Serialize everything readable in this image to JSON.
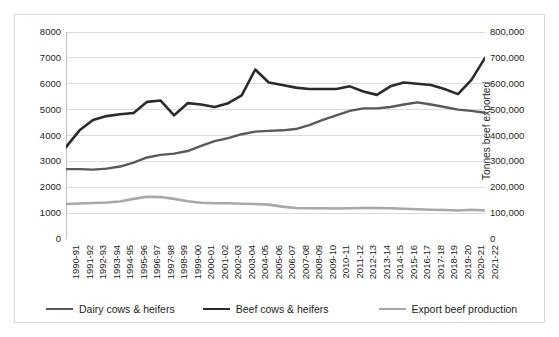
{
  "chart_data": {
    "type": "line",
    "title": "",
    "xlabel": "",
    "ylabel": "Head ('000s)",
    "y2label": "Tonnes beef exported",
    "ylim": [
      0,
      8000
    ],
    "y2lim": [
      0,
      800000
    ],
    "grid": true,
    "legend_position": "bottom",
    "categories": [
      "1990-91",
      "1991-92",
      "1992-93",
      "1993-94",
      "1994-95",
      "1995-96",
      "1996-97",
      "1997-98",
      "1998-99",
      "1999-00",
      "2000-01",
      "2001-02",
      "2002-03",
      "2003-04",
      "2004-05",
      "2005-06",
      "2006-07",
      "2007-08",
      "2008-09",
      "2009-10",
      "2010-11",
      "2011-12",
      "2012-13",
      "2013-14",
      "2014-15",
      "2015-16",
      "2016-17",
      "2017-18",
      "2018-19",
      "2019-20",
      "2020-21",
      "2021-22"
    ],
    "y_ticks": [
      0,
      1000,
      2000,
      3000,
      4000,
      5000,
      6000,
      7000,
      8000
    ],
    "y_tick_labels": [
      "0",
      "1000",
      "2000",
      "3000",
      "4000",
      "5000",
      "6000",
      "7000",
      "8000"
    ],
    "y2_ticks": [
      0,
      100000,
      200000,
      300000,
      400000,
      500000,
      600000,
      700000,
      800000
    ],
    "y2_tick_labels": [
      "0",
      "100,000",
      "200,000",
      "300,000",
      "400,000",
      "500,000",
      "600,000",
      "700,000",
      "800,000"
    ],
    "series": [
      {
        "name": "Beef cows & heifers",
        "axis": "left",
        "color": "#2b2b2b",
        "width": 2.6,
        "values": [
          3550,
          4200,
          4600,
          4750,
          4820,
          4870,
          5300,
          5350,
          4780,
          5250,
          5200,
          5100,
          5250,
          5550,
          6550,
          6050,
          5950,
          5850,
          5800,
          5800,
          5800,
          5900,
          5700,
          5570,
          5900,
          6050,
          6000,
          5950,
          5800,
          5600,
          6150,
          7000
        ]
      },
      {
        "name": "Dairy cows & heifers",
        "axis": "left",
        "color": "#595959",
        "width": 2.4,
        "values": [
          2700,
          2700,
          2680,
          2720,
          2800,
          2950,
          3150,
          3250,
          3300,
          3400,
          3600,
          3780,
          3900,
          4050,
          4150,
          4180,
          4200,
          4250,
          4400,
          4600,
          4780,
          4950,
          5050,
          5050,
          5100,
          5200,
          5280,
          5200,
          5100,
          5000,
          4950,
          4880
        ]
      },
      {
        "name": "Export beef production",
        "axis": "right",
        "color": "#a8a8a8",
        "width": 2.6,
        "values": [
          135000,
          137000,
          139000,
          141000,
          145000,
          155000,
          163000,
          162000,
          155000,
          146000,
          140000,
          138000,
          138000,
          136000,
          135000,
          133000,
          125000,
          120000,
          119000,
          119000,
          118000,
          119000,
          120000,
          120000,
          119000,
          117000,
          115000,
          113000,
          112000,
          110000,
          113000,
          110000
        ]
      }
    ],
    "legend": [
      {
        "label": "Dairy cows & heifers",
        "color": "#595959"
      },
      {
        "label": "Beef cows & heifers",
        "color": "#2b2b2b"
      },
      {
        "label": "Export beef production",
        "color": "#a8a8a8"
      }
    ]
  }
}
